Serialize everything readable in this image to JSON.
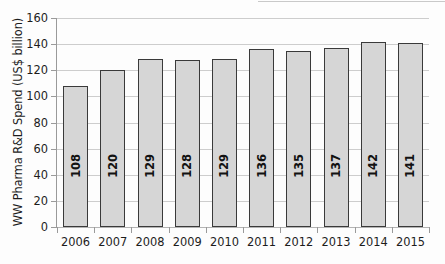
{
  "chart_data": {
    "type": "bar",
    "title": "",
    "subtitle": "",
    "xlabel": "",
    "ylabel": "WW Pharma R&D Spend (US$ billion)",
    "categories": [
      "2006",
      "2007",
      "2008",
      "2009",
      "2010",
      "2011",
      "2012",
      "2013",
      "2014",
      "2015"
    ],
    "values": [
      108,
      120,
      129,
      128,
      129,
      136,
      135,
      137,
      142,
      141
    ],
    "value_labels": [
      "108",
      "120",
      "129",
      "128",
      "129",
      "136",
      "135",
      "137",
      "142",
      "141"
    ],
    "ylim": [
      0,
      160
    ],
    "ytick_labels": [
      "0",
      "20",
      "40",
      "60",
      "80",
      "100",
      "120",
      "140",
      "160"
    ],
    "ytick_values": [
      0,
      20,
      40,
      60,
      80,
      100,
      120,
      140,
      160
    ],
    "grid": true,
    "legend": false,
    "legend_position": "none",
    "bar_fill_color": "#d6d6d6",
    "bar_border_color": "#3a3a3a",
    "gridline_color": "#cdcdcd",
    "axis_color": "#9a9a9a",
    "text_color": "#1c1c1c",
    "background_color": "#fdfdfd",
    "value_label_orientation": "vertical"
  }
}
